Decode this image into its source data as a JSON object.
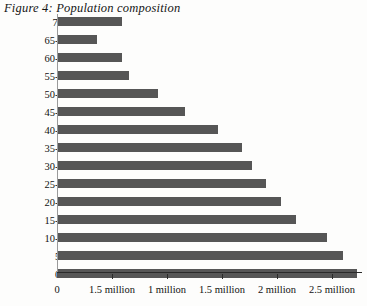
{
  "figure": {
    "title": "Figure 4: Population composition",
    "bar_color": "#565656",
    "axis_color": "#2a2a2a"
  },
  "chart_data": {
    "type": "bar",
    "orientation": "horizontal",
    "title": "Figure 4: Population composition",
    "xlabel": "",
    "ylabel": "",
    "grid": false,
    "legend": null,
    "xlim": [
      0,
      2.75
    ],
    "categories": [
      "70+",
      "65-69",
      "60-64",
      "55-59",
      "50-54",
      "45-49",
      "40-44",
      "35-39",
      "30-34",
      "25-29",
      "20-24",
      "15-19",
      "10-14",
      "5-9",
      "0-4"
    ],
    "values": [
      0.59,
      0.36,
      0.59,
      0.65,
      0.92,
      1.16,
      1.46,
      1.68,
      1.77,
      1.9,
      2.04,
      2.17,
      2.45,
      2.6,
      2.73
    ],
    "value_unit": "million",
    "xticks": [
      0,
      0.5,
      1.0,
      1.5,
      2.0,
      2.5
    ],
    "xticklabels": [
      "0",
      "1.5 million",
      "1 million",
      "1.5 million",
      "2 million",
      "2.5 million"
    ]
  }
}
